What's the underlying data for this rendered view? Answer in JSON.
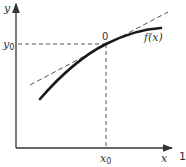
{
  "diagram": {
    "type": "tangent-line-illustration",
    "labels": {
      "y_axis": "y",
      "x_axis": "x",
      "y0": "y",
      "y0_sub": "0",
      "x0": "x",
      "x0_sub": "0",
      "point": "0",
      "curve": "f(x)",
      "edge_mark": "1"
    },
    "colors": {
      "axis": "#333333",
      "curve": "#1a1a1a",
      "dashed": "#555555",
      "background": "#ffffff"
    }
  }
}
